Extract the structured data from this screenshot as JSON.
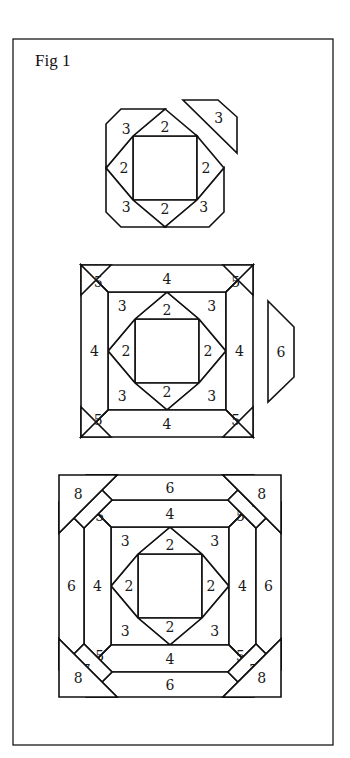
{
  "figure": {
    "title": "Fig 1",
    "steps": [
      {
        "name": "step-round-3",
        "description": "Center square with round 2 and round 3 pieces; one round 3 piece shown detached",
        "pieces": [
          {
            "id": "center",
            "label": ""
          },
          {
            "id": "r2-top",
            "label": "2"
          },
          {
            "id": "r2-right",
            "label": "2"
          },
          {
            "id": "r2-bottom",
            "label": "2"
          },
          {
            "id": "r2-left",
            "label": "2"
          },
          {
            "id": "r3-topleft",
            "label": "3"
          },
          {
            "id": "r3-bottomright",
            "label": "3"
          },
          {
            "id": "r3-bottomleft",
            "label": "3"
          },
          {
            "id": "r3-topright-detached",
            "label": "3"
          }
        ]
      },
      {
        "name": "step-round-6",
        "description": "Rounds 2 through 5 sewn; one round 6 piece shown detached",
        "pieces": [
          {
            "id": "center",
            "label": ""
          },
          {
            "id": "r2-top",
            "label": "2"
          },
          {
            "id": "r2-right",
            "label": "2"
          },
          {
            "id": "r2-bottom",
            "label": "2"
          },
          {
            "id": "r2-left",
            "label": "2"
          },
          {
            "id": "r3-topleft",
            "label": "3"
          },
          {
            "id": "r3-topright",
            "label": "3"
          },
          {
            "id": "r3-bottomright",
            "label": "3"
          },
          {
            "id": "r3-bottomleft",
            "label": "3"
          },
          {
            "id": "r4-top",
            "label": "4"
          },
          {
            "id": "r4-right",
            "label": "4"
          },
          {
            "id": "r4-bottom",
            "label": "4"
          },
          {
            "id": "r4-left",
            "label": "4"
          },
          {
            "id": "r5-topleft",
            "label": "5"
          },
          {
            "id": "r5-topright",
            "label": "5"
          },
          {
            "id": "r5-bottomright",
            "label": "5"
          },
          {
            "id": "r5-bottomleft",
            "label": "5"
          },
          {
            "id": "r6-right-detached",
            "label": "6"
          }
        ]
      },
      {
        "name": "step-complete",
        "description": "Completed block with rounds 2 through 8",
        "pieces": [
          {
            "id": "center",
            "label": ""
          },
          {
            "id": "r2-top",
            "label": "2"
          },
          {
            "id": "r2-right",
            "label": "2"
          },
          {
            "id": "r2-bottom",
            "label": "2"
          },
          {
            "id": "r2-left",
            "label": "2"
          },
          {
            "id": "r3-topleft",
            "label": "3"
          },
          {
            "id": "r3-topright",
            "label": "3"
          },
          {
            "id": "r3-bottomright",
            "label": "3"
          },
          {
            "id": "r3-bottomleft",
            "label": "3"
          },
          {
            "id": "r4-top",
            "label": "4"
          },
          {
            "id": "r4-right",
            "label": "4"
          },
          {
            "id": "r4-bottom",
            "label": "4"
          },
          {
            "id": "r4-left",
            "label": "4"
          },
          {
            "id": "r5-topleft",
            "label": "5"
          },
          {
            "id": "r5-topright",
            "label": "5"
          },
          {
            "id": "r5-bottomright",
            "label": "5"
          },
          {
            "id": "r5-bottomleft",
            "label": "5"
          },
          {
            "id": "r6-top",
            "label": "6"
          },
          {
            "id": "r6-right",
            "label": "6"
          },
          {
            "id": "r6-bottom",
            "label": "6"
          },
          {
            "id": "r6-left",
            "label": "6"
          },
          {
            "id": "r7-topleft",
            "label": "7"
          },
          {
            "id": "r7-topright",
            "label": "7"
          },
          {
            "id": "r7-bottomright",
            "label": "7"
          },
          {
            "id": "r7-bottomleft",
            "label": "7"
          },
          {
            "id": "r8-topleft",
            "label": "8"
          },
          {
            "id": "r8-topright",
            "label": "8"
          },
          {
            "id": "r8-bottomright",
            "label": "8"
          },
          {
            "id": "r8-bottomleft",
            "label": "8"
          }
        ]
      }
    ]
  }
}
